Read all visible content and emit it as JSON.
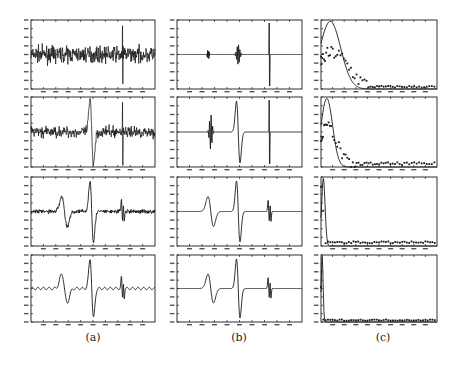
{
  "figure": {
    "columns": [
      {
        "id": "a",
        "caption": "(a)",
        "description": "noisy signal at decreasing noise levels"
      },
      {
        "id": "b",
        "caption": "(b)",
        "description": "denoised / reconstructed signal"
      },
      {
        "id": "c",
        "caption": "(c)",
        "description": "histogram / distribution with fitted curve"
      }
    ],
    "colors": {
      "ink": "#1a1a1a",
      "background": "#ffffff",
      "frame": "#333333"
    }
  },
  "chart_data": [
    {
      "panel": "a1",
      "type": "line",
      "title": "",
      "xlabel": "",
      "ylabel": "",
      "x_ticks": 10,
      "ylim": [
        -1,
        1
      ],
      "noise": 0.22,
      "components": [
        "noise",
        "spike@0.74"
      ]
    },
    {
      "panel": "b1",
      "type": "line",
      "title": "",
      "xlabel": "",
      "ylabel": "",
      "x_ticks": 10,
      "ylim": [
        -1,
        1
      ],
      "components": [
        "small-burst@0.25",
        "burst@0.49",
        "spike@0.74"
      ]
    },
    {
      "panel": "c1",
      "type": "scatter+line",
      "title": "",
      "xlabel": "",
      "ylabel": "",
      "fit": "gaussian",
      "peak_x": 0.08,
      "width": 0.09,
      "points_desc": "scattered dots tracking a Gaussian-like decay, tail near zero after x≈0.35"
    },
    {
      "panel": "a2",
      "type": "line",
      "ylim": [
        -1,
        1
      ],
      "noise": 0.15,
      "components": [
        "noise",
        "wavelet@0.49",
        "spike@0.74"
      ]
    },
    {
      "panel": "b2",
      "type": "line",
      "ylim": [
        -1,
        1
      ],
      "components": [
        "burst@0.27",
        "wavelet@0.49",
        "spike@0.74"
      ]
    },
    {
      "panel": "c2",
      "type": "scatter+line",
      "fit": "gaussian",
      "peak_x": 0.05,
      "width": 0.05
    },
    {
      "panel": "a3",
      "type": "line",
      "ylim": [
        -1,
        1
      ],
      "noise": 0.06,
      "components": [
        "noise",
        "wavelet@0.27",
        "wavelet@0.49",
        "double-spike@0.74"
      ]
    },
    {
      "panel": "b3",
      "type": "line",
      "ylim": [
        -1,
        1
      ],
      "components": [
        "wavelet@0.27",
        "wavelet@0.49",
        "double-spike@0.74"
      ]
    },
    {
      "panel": "c3",
      "type": "scatter+line",
      "fit": "spike",
      "peak_x": 0.02,
      "width": 0.015
    },
    {
      "panel": "a4",
      "type": "line",
      "ylim": [
        -1,
        1
      ],
      "noise": 0.02,
      "components": [
        "ripple",
        "wavelet@0.27",
        "wavelet@0.49",
        "double-spike@0.74"
      ]
    },
    {
      "panel": "b4",
      "type": "line",
      "ylim": [
        -1,
        1
      ],
      "components": [
        "wavelet@0.27",
        "wavelet@0.49",
        "double-spike@0.74"
      ]
    },
    {
      "panel": "c4",
      "type": "scatter+line",
      "fit": "spike",
      "peak_x": 0.01,
      "width": 0.008
    }
  ]
}
